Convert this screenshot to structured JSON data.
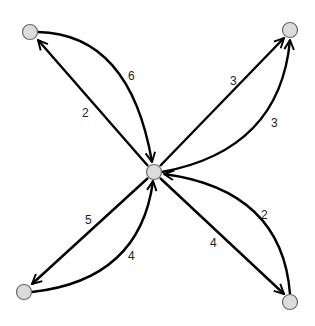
{
  "diagram": {
    "type": "directed-weighted-graph",
    "nodes": [
      {
        "id": "center",
        "x": 154,
        "y": 172
      },
      {
        "id": "top-left",
        "x": 30,
        "y": 32
      },
      {
        "id": "top-right",
        "x": 290,
        "y": 30
      },
      {
        "id": "bottom-left",
        "x": 24,
        "y": 292
      },
      {
        "id": "bottom-right",
        "x": 290,
        "y": 302
      }
    ],
    "edges": [
      {
        "from": "top-left",
        "to": "center",
        "weight": "6",
        "shape": "curved"
      },
      {
        "from": "center",
        "to": "top-left",
        "weight": "2",
        "shape": "straight"
      },
      {
        "from": "center",
        "to": "top-right",
        "weight": "3",
        "shape": "straight"
      },
      {
        "from": "center",
        "to": "top-right",
        "weight": "3",
        "shape": "curved"
      },
      {
        "from": "center",
        "to": "bottom-left",
        "weight": "5",
        "shape": "straight"
      },
      {
        "from": "bottom-left",
        "to": "center",
        "weight": "4",
        "shape": "curved"
      },
      {
        "from": "center",
        "to": "bottom-right",
        "weight": "4",
        "shape": "straight"
      },
      {
        "from": "bottom-right",
        "to": "center",
        "weight": "2",
        "shape": "curved"
      }
    ]
  },
  "labels": {
    "tl_curved": "6",
    "tl_straight": "2",
    "tr_straight": "3",
    "tr_curved": "3",
    "bl_straight": "5",
    "bl_curved": "4",
    "br_straight": "4",
    "br_curved": "2"
  }
}
